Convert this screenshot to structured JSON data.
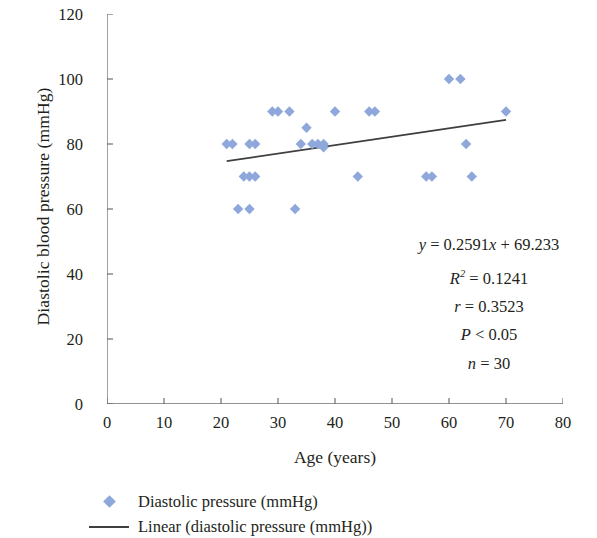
{
  "chart_data": {
    "type": "scatter",
    "title": "",
    "xlabel": "Age (years)",
    "ylabel": "Diastolic blood pressure (mmHg)",
    "xlim": [
      0,
      80
    ],
    "ylim": [
      0,
      120
    ],
    "xticks": [
      0,
      10,
      20,
      30,
      40,
      50,
      60,
      70,
      80
    ],
    "yticks": [
      0,
      20,
      40,
      60,
      80,
      100,
      120
    ],
    "grid": false,
    "legend_position": "below-left",
    "marker_color": "#8FA8DC",
    "line_color": "#3f3f3f",
    "axis_color": "#6e6e6e",
    "series": [
      {
        "name": "Diastolic pressure (mmHg)",
        "type": "scatter",
        "marker": "diamond",
        "color": "#8FA8DC",
        "points": [
          [
            22,
            80
          ],
          [
            25,
            80
          ],
          [
            26,
            80
          ],
          [
            29,
            90
          ],
          [
            30,
            90
          ],
          [
            32,
            90
          ],
          [
            34,
            80
          ],
          [
            35,
            85
          ],
          [
            37,
            80
          ],
          [
            38,
            80
          ],
          [
            40,
            90
          ],
          [
            44,
            70
          ],
          [
            46,
            90
          ],
          [
            47,
            90
          ],
          [
            60,
            100
          ],
          [
            62,
            100
          ],
          [
            63,
            80
          ],
          [
            64,
            70
          ],
          [
            70,
            90
          ],
          [
            24,
            70
          ],
          [
            25,
            70
          ],
          [
            26,
            70
          ],
          [
            23,
            60
          ],
          [
            25,
            60
          ],
          [
            33,
            60
          ],
          [
            56,
            70
          ],
          [
            57,
            70
          ],
          [
            21,
            80
          ],
          [
            36,
            80
          ],
          [
            38,
            79
          ]
        ]
      },
      {
        "name": "Linear (diastolic pressure (mmHg))",
        "type": "line",
        "color": "#3f3f3f",
        "x_range": [
          21,
          70
        ],
        "y_range": [
          74.7,
          87.4
        ],
        "slope": 0.2591,
        "intercept": 69.233
      }
    ],
    "annotations": {
      "equation": "y = 0.2591x + 69.233",
      "r_squared": "R² = 0.1241",
      "r": "r = 0.3523",
      "p_value": "P < 0.05",
      "n": "n = 30"
    }
  },
  "axes": {
    "ylabel": "Diastolic blood pressure (mmHg)",
    "xlabel": "Age (years)",
    "ytick_labels": [
      "120",
      "100",
      "80",
      "60",
      "40",
      "20",
      "0"
    ],
    "xtick_labels": [
      "0",
      "10",
      "20",
      "30",
      "40",
      "50",
      "60",
      "70",
      "80"
    ]
  },
  "stats": {
    "eq_y": "y",
    "eq_body": " = 0.2591",
    "eq_x": "x",
    "eq_tail": " + 69.233",
    "r2_sym": "R",
    "r2_sup": "2",
    "r2_val": " = 0.1241",
    "r_sym": "r",
    "r_val": " = 0.3523",
    "p_sym": "P",
    "p_val": " < 0.05",
    "n_sym": "n",
    "n_val": " = 30"
  },
  "legend": {
    "items": [
      {
        "key": "diamond-marker",
        "label": "Diastolic pressure (mmHg)",
        "color": "#8FA8DC"
      },
      {
        "key": "line-marker",
        "label": "Linear (diastolic pressure (mmHg))",
        "color": "#3f3f3f"
      }
    ]
  }
}
